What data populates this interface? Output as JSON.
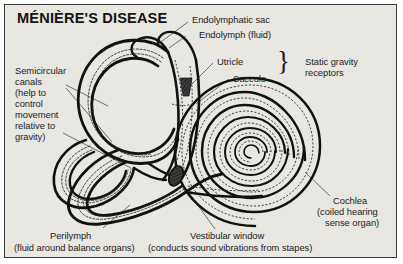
{
  "diagram": {
    "title": "MÉNIÈRE'S DISEASE",
    "background_color": "#e9e7e2",
    "border_color": "#3a3a38",
    "ink_color": "#111111",
    "type": "anatomical-diagram"
  },
  "labels": {
    "semicircular_canals": {
      "line1": "Semicircular",
      "line2": "canals",
      "line3": "(help to",
      "line4": "control",
      "line5": "movement",
      "line6": "relative to",
      "line7": "gravity)"
    },
    "endolymphatic_sac": "Endolymphatic sac",
    "endolymph": "Endolymph (fluid)",
    "utricle": "Utricle",
    "saccule": "Saccule",
    "static_gravity_receptors": {
      "line1": "Static gravity",
      "line2": "receptors",
      "brace": "}"
    },
    "cochlea": {
      "line1": "Cochlea",
      "line2": "(coiled hearing",
      "line3": "sense organ)"
    },
    "perilymph": {
      "line1": "Perilymph",
      "line2": "(fluid around balance organs)"
    },
    "vestibular_window": {
      "line1": "Vestibular window",
      "line2": "(conducts sound vibrations from stapes)"
    }
  }
}
